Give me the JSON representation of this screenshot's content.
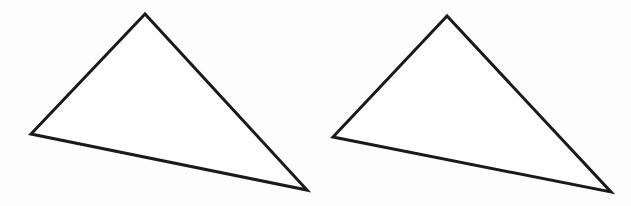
{
  "diagram": {
    "width": 631,
    "height": 206,
    "background": "#fdfdfd",
    "stroke_color": "#1a1a1a",
    "stroke_width": 3,
    "shapes": [
      {
        "id": "triangle-left",
        "type": "triangle",
        "points": [
          [
            145,
            14
          ],
          [
            31,
            134
          ],
          [
            307,
            190
          ]
        ],
        "fill": "#ffffff"
      },
      {
        "id": "triangle-right",
        "type": "triangle",
        "points": [
          [
            447,
            16
          ],
          [
            333,
            137
          ],
          [
            611,
            192
          ]
        ],
        "fill": "#ffffff"
      }
    ]
  }
}
